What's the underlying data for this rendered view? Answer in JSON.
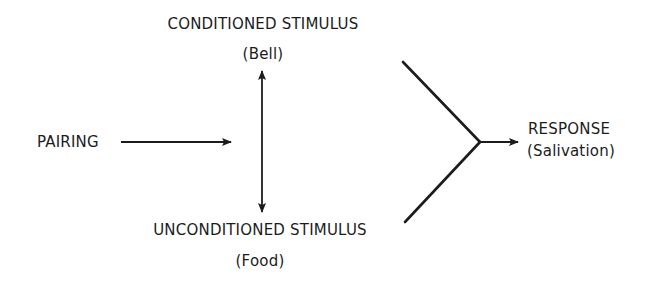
{
  "diagram": {
    "type": "classical-conditioning-flow",
    "nodes": {
      "conditioned_stimulus": {
        "title": "CONDITIONED STIMULUS",
        "subtitle": "(Bell)"
      },
      "unconditioned_stimulus": {
        "title": "UNCONDITIONED STIMULUS",
        "subtitle": "(Food)"
      },
      "pairing": {
        "title": "PAIRING"
      },
      "response": {
        "title": "RESPONSE",
        "subtitle": "(Salivation)"
      }
    },
    "edges": [
      {
        "from": "pairing",
        "to": "stimulus-link",
        "style": "single-arrow"
      },
      {
        "from": "conditioned_stimulus",
        "to": "unconditioned_stimulus",
        "style": "double-arrow"
      },
      {
        "from": "conditioned_stimulus",
        "to": "response",
        "style": "converging-line"
      },
      {
        "from": "unconditioned_stimulus",
        "to": "response",
        "style": "converging-line"
      }
    ],
    "colors": {
      "ink": "#1c1c1c",
      "background": "#ffffff"
    }
  }
}
